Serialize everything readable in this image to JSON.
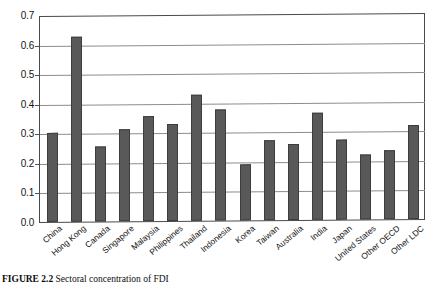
{
  "figure": {
    "caption_label": "FIGURE 2.2",
    "caption_text": "Sectoral concentration of FDI"
  },
  "chart_data": {
    "type": "bar",
    "title": "",
    "xlabel": "",
    "ylabel": "",
    "ylim": [
      0.0,
      0.7
    ],
    "grid": true,
    "legend": "none",
    "ytick_labels": [
      "0.7",
      "0.6",
      "0.5",
      "0.4",
      "0.3",
      "0.2",
      "0.1",
      "0.0"
    ],
    "ytick_values": [
      0.7,
      0.6,
      0.5,
      0.4,
      0.3,
      0.2,
      0.1,
      0.0
    ],
    "bar_color": "#595959",
    "categories": [
      "China",
      "Hong Kong",
      "Canada",
      "Singapore",
      "Malaysia",
      "Philippines",
      "Thailand",
      "Indonesia",
      "Korea",
      "Taiwan",
      "Australia",
      "India",
      "Japan",
      "United States",
      "Other OECD",
      "Other LDC"
    ],
    "values": [
      0.3,
      0.625,
      0.255,
      0.31,
      0.355,
      0.327,
      0.425,
      0.375,
      0.19,
      0.27,
      0.257,
      0.362,
      0.272,
      0.22,
      0.232,
      0.318
    ]
  }
}
